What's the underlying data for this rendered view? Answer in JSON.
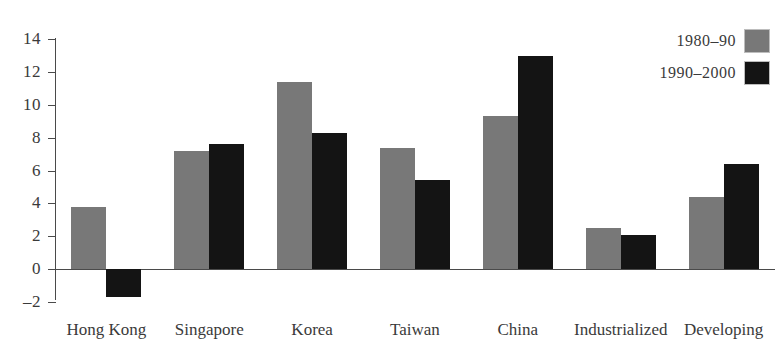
{
  "chart_data": {
    "type": "bar",
    "title": "",
    "subtitle": "",
    "xlabel": "",
    "ylabel": "",
    "categories": [
      "Hong Kong",
      "Singapore",
      "Korea",
      "Taiwan",
      "China",
      "Industrialized",
      "Developing"
    ],
    "series": [
      {
        "name": "1980–90",
        "color": "#787878",
        "values": [
          3.8,
          7.2,
          11.4,
          7.4,
          9.3,
          2.5,
          4.4
        ]
      },
      {
        "name": "1990–2000",
        "color": "#141414",
        "values": [
          -1.7,
          7.6,
          8.3,
          5.4,
          13.0,
          2.1,
          6.4
        ]
      }
    ],
    "ylim": [
      -2,
      14
    ],
    "ytick_step": 2,
    "ytick_labels": [
      "14",
      "12",
      "10",
      "8",
      "6",
      "4",
      "2",
      "0",
      "–2"
    ],
    "ytick_values": [
      14,
      12,
      10,
      8,
      6,
      4,
      2,
      0,
      -2
    ],
    "grid": false,
    "legend_position": "top-right",
    "axis_color": "#4a4a4a",
    "background": "#ffffff"
  }
}
